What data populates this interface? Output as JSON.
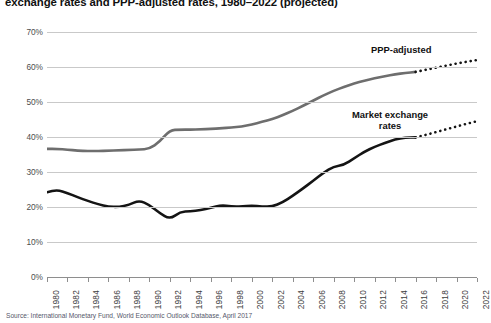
{
  "title": "exchange rates and PPP-adjusted rates, 1980–2022 (projected)",
  "source_note": "Source: International Monetary Fund, World Economic Outlook Database, April 2017",
  "annotations": {
    "ppp": "PPP-adjusted",
    "market": "Market exchange\nrates"
  },
  "colors": {
    "ppp_line": "#6e6e6e",
    "market_line": "#141414",
    "gridline": "#c9c9c9",
    "axis": "#8e8e8e",
    "background": "#ffffff",
    "title_text": "#111111",
    "tick_text": "#4d4d4d"
  },
  "chart_data": {
    "type": "line",
    "title": "exchange rates and PPP-adjusted rates, 1980–2022 (projected)",
    "xlabel": "",
    "ylabel": "",
    "xlim": [
      1980,
      2022
    ],
    "ylim": [
      0,
      70
    ],
    "y_unit": "%",
    "grid": true,
    "legend": "inline-annotations",
    "projection_starts": 2016,
    "y_ticks": [
      "0%",
      "10%",
      "20%",
      "30%",
      "40%",
      "50%",
      "60%",
      "70%"
    ],
    "y_tick_values": [
      0,
      10,
      20,
      30,
      40,
      50,
      60,
      70
    ],
    "x_ticks": [
      "1980",
      "1982",
      "1984",
      "1986",
      "1988",
      "1990",
      "1992",
      "1994",
      "1996",
      "1998",
      "2000",
      "2002",
      "2004",
      "2006",
      "2008",
      "2010",
      "2012",
      "2014",
      "2016",
      "2018",
      "2020",
      "2022"
    ],
    "x_tick_values": [
      1980,
      1982,
      1984,
      1986,
      1988,
      1990,
      1992,
      1994,
      1996,
      1998,
      2000,
      2002,
      2004,
      2006,
      2008,
      2010,
      2012,
      2014,
      2016,
      2018,
      2020,
      2022
    ],
    "x": [
      1980,
      1981,
      1982,
      1983,
      1984,
      1985,
      1986,
      1987,
      1988,
      1989,
      1990,
      1991,
      1992,
      1993,
      1994,
      1995,
      1996,
      1997,
      1998,
      1999,
      2000,
      2001,
      2002,
      2003,
      2004,
      2005,
      2006,
      2007,
      2008,
      2009,
      2010,
      2011,
      2012,
      2013,
      2014,
      2015,
      2016,
      2017,
      2018,
      2019,
      2020,
      2021,
      2022
    ],
    "series": [
      {
        "name": "PPP-adjusted",
        "color": "#6e6e6e",
        "style": "solid",
        "values": [
          36.6,
          36.6,
          36.4,
          36.1,
          36.0,
          36.0,
          36.1,
          36.2,
          36.3,
          36.4,
          36.6,
          38.6,
          42.0,
          42.1,
          42.1,
          42.2,
          42.3,
          42.5,
          42.7,
          43.0,
          43.6,
          44.3,
          45.1,
          46.2,
          47.5,
          48.9,
          50.4,
          51.9,
          53.2,
          54.3,
          55.3,
          56.1,
          56.8,
          57.4,
          57.9,
          58.3,
          58.6,
          null,
          null,
          null,
          null,
          null,
          null
        ]
      },
      {
        "name": "PPP-adjusted (projected)",
        "color": "#141414",
        "style": "dotted",
        "values": [
          null,
          null,
          null,
          null,
          null,
          null,
          null,
          null,
          null,
          null,
          null,
          null,
          null,
          null,
          null,
          null,
          null,
          null,
          null,
          null,
          null,
          null,
          null,
          null,
          null,
          null,
          null,
          null,
          null,
          null,
          null,
          null,
          null,
          null,
          null,
          null,
          58.6,
          59.2,
          59.8,
          60.4,
          61.0,
          61.5,
          62.0
        ]
      },
      {
        "name": "Market exchange rates",
        "color": "#141414",
        "style": "solid",
        "values": [
          24.2,
          24.9,
          24.0,
          22.8,
          21.7,
          20.8,
          20.1,
          20.0,
          20.6,
          21.9,
          20.6,
          18.3,
          16.5,
          18.6,
          18.8,
          19.1,
          19.8,
          20.5,
          20.2,
          20.1,
          20.4,
          20.1,
          20.1,
          21.3,
          23.2,
          25.3,
          27.5,
          29.8,
          31.6,
          32.0,
          33.9,
          35.8,
          37.2,
          38.3,
          39.3,
          39.8,
          39.9,
          null,
          null,
          null,
          null,
          null,
          null
        ]
      },
      {
        "name": "Market exchange rates (projected)",
        "color": "#141414",
        "style": "dotted",
        "values": [
          null,
          null,
          null,
          null,
          null,
          null,
          null,
          null,
          null,
          null,
          null,
          null,
          null,
          null,
          null,
          null,
          null,
          null,
          null,
          null,
          null,
          null,
          null,
          null,
          null,
          null,
          null,
          null,
          null,
          null,
          null,
          null,
          null,
          null,
          null,
          null,
          39.9,
          40.6,
          41.4,
          42.2,
          43.0,
          43.8,
          44.5
        ]
      }
    ]
  }
}
